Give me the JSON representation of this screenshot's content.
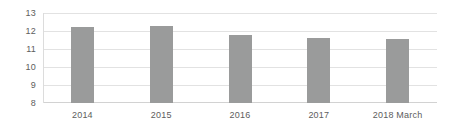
{
  "chart_data": {
    "type": "bar",
    "title": "",
    "xlabel": "",
    "ylabel": "",
    "categories": [
      "2014",
      "2015",
      "2016",
      "2017",
      "2018 March"
    ],
    "values": [
      12.2,
      12.25,
      11.75,
      11.6,
      11.55
    ],
    "ylim": [
      8,
      13
    ],
    "yticks": [
      "13",
      "12",
      "11",
      "10",
      "9",
      "8"
    ],
    "ytick_values": [
      13,
      12,
      11,
      10,
      9,
      8
    ],
    "grid": true,
    "legend": "none",
    "series": [
      {
        "name": "",
        "values": [
          12.2,
          12.25,
          11.75,
          11.6,
          11.55
        ]
      }
    ],
    "colors": {
      "bar": "#9a9b9b",
      "gridline": "#e2e2e2",
      "axis": "#d2d2d2",
      "text": "#5d5d5d",
      "background": "#ffffff"
    }
  }
}
